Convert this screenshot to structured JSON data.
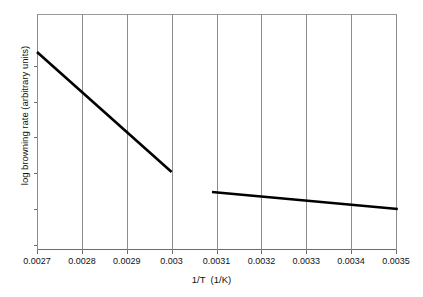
{
  "chart_data": {
    "type": "line",
    "title": "",
    "xlabel": "1/T  (1/K)",
    "ylabel": "log browning rate (arbitrary units)",
    "xlim": [
      0.0027,
      0.0035
    ],
    "ylim": [
      0,
      1
    ],
    "grid": "vertical",
    "legend": "none",
    "xticklabels": [
      "0.0027",
      "0.0028",
      "0.0029",
      "0.003",
      "0.0031",
      "0.0032",
      "0.0033",
      "0.0034",
      "0.0035"
    ],
    "xticks": [
      0.0027,
      0.0028,
      0.0029,
      0.003,
      0.0031,
      0.0032,
      0.0033,
      0.0034,
      0.0035
    ],
    "yticklabels": [],
    "series": [
      {
        "name": "high-temperature branch",
        "color": "#000000",
        "x": [
          0.0027,
          0.003
        ],
        "y": [
          0.839,
          0.3305
        ]
      },
      {
        "name": "low-temperature branch",
        "color": "#000000",
        "x": [
          0.00309,
          0.003504
        ],
        "y": [
          0.2458,
          0.1737
        ]
      }
    ]
  },
  "axes": {
    "x_title": "1/T  (1/K)",
    "y_title": "log browning rate (arbitrary units)",
    "x_tick_labels": [
      "0.0027",
      "0.0028",
      "0.0029",
      "0.003",
      "0.0031",
      "0.0032",
      "0.0033",
      "0.0034",
      "0.0035"
    ],
    "gridline_color": "#8c8c8c",
    "line_color": "#000000"
  }
}
